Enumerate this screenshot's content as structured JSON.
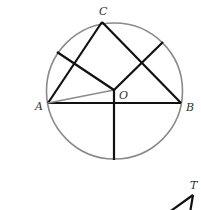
{
  "diagram": {
    "type": "geometry",
    "colors": {
      "circle": "#8a8a8a",
      "segments": "#111111",
      "radius_OA": "#8a8a8a",
      "labels": "#333333"
    },
    "points": {
      "A": {
        "label": "A",
        "x": 48,
        "y": 103
      },
      "B": {
        "label": "B",
        "x": 181,
        "y": 103
      },
      "C": {
        "label": "C",
        "x": 102,
        "y": 22
      },
      "O": {
        "label": "O",
        "x": 114,
        "y": 90
      },
      "T": {
        "label": "T",
        "x": 193,
        "y": 193
      }
    },
    "circle": {
      "cx": 114.5,
      "cy": 91,
      "r": 68
    },
    "labels": {
      "A": "A",
      "B": "B",
      "C": "C",
      "O": "O",
      "T": "T"
    }
  }
}
